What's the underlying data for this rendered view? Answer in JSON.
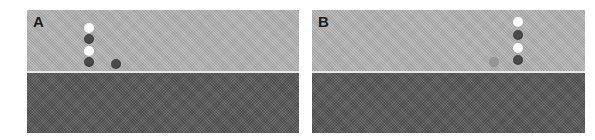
{
  "panels": [
    {
      "id": "A",
      "label": "A",
      "colors": {
        "upper": "#b4b4b4",
        "lower": "#5c5c5c",
        "divider": "#e8e8e8"
      },
      "dots": [
        {
          "color": "white",
          "x": 62,
          "y": 18
        },
        {
          "color": "dark",
          "x": 62,
          "y": 29
        },
        {
          "color": "white",
          "x": 62,
          "y": 41
        },
        {
          "color": "dark",
          "x": 62,
          "y": 52
        },
        {
          "color": "dark",
          "x": 89,
          "y": 54
        }
      ]
    },
    {
      "id": "B",
      "label": "B",
      "colors": {
        "upper": "#b4b4b4",
        "lower": "#5c5c5c",
        "divider": "#e8e8e8"
      },
      "dots": [
        {
          "color": "white",
          "x": 206,
          "y": 12
        },
        {
          "color": "dark",
          "x": 206,
          "y": 25
        },
        {
          "color": "white",
          "x": 206,
          "y": 38
        },
        {
          "color": "dark",
          "x": 206,
          "y": 50
        },
        {
          "color": "gray",
          "x": 182,
          "y": 52
        }
      ]
    }
  ]
}
